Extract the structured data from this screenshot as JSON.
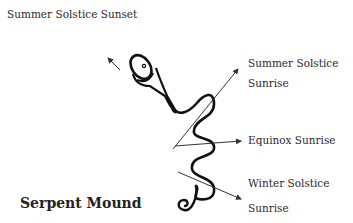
{
  "diagram": {
    "title": "Serpent Mound",
    "labels": {
      "summer_sunset": "Summer Solstice Sunset",
      "summer_sunrise_line1": "Summer Solstice",
      "summer_sunrise_line2": "Sunrise",
      "equinox_sunrise": "Equinox Sunrise",
      "winter_sunrise_line1": "Winter Solstice",
      "winter_sunrise_line2": "Sunrise"
    },
    "colors": {
      "serpent": "#111111",
      "arrows": "#333333",
      "text": "#2a2a2a",
      "background": "#ffffff"
    }
  }
}
